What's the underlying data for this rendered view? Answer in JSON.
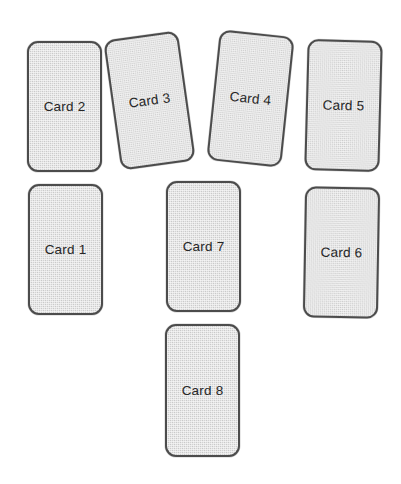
{
  "canvas": {
    "width": 401,
    "height": 484,
    "background_color": "#ffffff"
  },
  "style": {
    "card_fill_color": "#d3d3d3",
    "card_border_color": "#4c4c4c",
    "card_label_color": "#262626",
    "card_texture": "fine-crosshatch-weave"
  },
  "cards": [
    {
      "id": "card-2",
      "label": "Card 2",
      "left": 27,
      "top": 41,
      "width": 75,
      "height": 131,
      "rotation_deg": 0
    },
    {
      "id": "card-3",
      "label": "Card 3",
      "left": 112,
      "top": 35,
      "width": 75,
      "height": 131,
      "rotation_deg": -8
    },
    {
      "id": "card-4",
      "label": "Card 4",
      "left": 213,
      "top": 33,
      "width": 75,
      "height": 131,
      "rotation_deg": 6
    },
    {
      "id": "card-5",
      "label": "Card 5",
      "left": 306,
      "top": 40,
      "width": 75,
      "height": 131,
      "rotation_deg": 1.5
    },
    {
      "id": "card-1",
      "label": "Card 1",
      "left": 28,
      "top": 184,
      "width": 75,
      "height": 131,
      "rotation_deg": 0
    },
    {
      "id": "card-7",
      "label": "Card 7",
      "left": 166,
      "top": 181,
      "width": 75,
      "height": 131,
      "rotation_deg": 0
    },
    {
      "id": "card-6",
      "label": "Card 6",
      "left": 304,
      "top": 187,
      "width": 75,
      "height": 131,
      "rotation_deg": 1
    },
    {
      "id": "card-8",
      "label": "Card 8",
      "left": 165,
      "top": 324,
      "width": 75,
      "height": 133,
      "rotation_deg": 0
    }
  ]
}
